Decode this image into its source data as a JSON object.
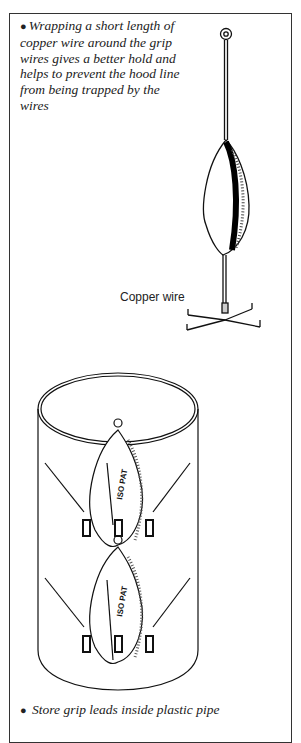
{
  "captions": {
    "top": "Wrapping a short length of copper wire around the grip wires gives a better hold and helps to prevent the hood line from being trapped by the wires",
    "bottom": "Store grip leads inside plastic pipe",
    "bullet": "●"
  },
  "illustration": {
    "label": "Copper wire",
    "grip_marking": "ISO PAT"
  }
}
